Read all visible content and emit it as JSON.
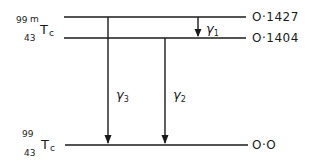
{
  "diagram": {
    "type": "nuclear-decay-scheme",
    "isotopes": {
      "parent": {
        "mass_number": "99",
        "metastable": "m",
        "atomic_number": "43",
        "symbol": "Tc"
      },
      "daughter": {
        "mass_number": "99",
        "atomic_number": "43",
        "symbol": "Tc"
      }
    },
    "levels": [
      {
        "id": "level-1427",
        "energy_label": "O·1427"
      },
      {
        "id": "level-1404",
        "energy_label": "O·1404"
      },
      {
        "id": "level-0",
        "energy_label": "O·O"
      }
    ],
    "transitions": [
      {
        "id": "gamma-1",
        "symbol": "γ",
        "index": "1",
        "from": "O·1427",
        "to": "O·1404"
      },
      {
        "id": "gamma-2",
        "symbol": "γ",
        "index": "2",
        "from": "O·1404",
        "to": "O·O"
      },
      {
        "id": "gamma-3",
        "symbol": "γ",
        "index": "3",
        "from": "O·1427",
        "to": "O·O"
      }
    ],
    "line_color": "#1a1a1a"
  }
}
